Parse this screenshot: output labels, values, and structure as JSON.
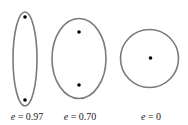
{
  "diagram": {
    "title": "",
    "stroke_color": "#7a7a7a",
    "focus_color": "#000000",
    "shapes": [
      {
        "type": "ellipse",
        "name": "ellipse-high-eccentricity",
        "cx": 25,
        "cy": 59,
        "rx": 12,
        "ry": 47,
        "foci": [
          [
            25,
            17
          ],
          [
            25,
            100
          ]
        ],
        "label_var": "e",
        "label_eq": " = 0.97",
        "label_x": 27
      },
      {
        "type": "ellipse",
        "name": "ellipse-medium-eccentricity",
        "cx": 79,
        "cy": 58.5,
        "rx": 27,
        "ry": 40,
        "foci": [
          [
            79,
            32
          ],
          [
            79,
            85
          ]
        ],
        "label_var": "e",
        "label_eq": " = 0.70",
        "label_x": 80
      },
      {
        "type": "circle",
        "name": "circle-zero-eccentricity",
        "cx": 149.5,
        "cy": 58.5,
        "rx": 29,
        "ry": 29,
        "foci": [
          [
            150.5,
            58
          ]
        ],
        "label_var": "e",
        "label_eq": " = 0",
        "label_x": 151
      }
    ],
    "labels": [
      "e = 0.97",
      "e = 0.70",
      "e = 0"
    ]
  }
}
